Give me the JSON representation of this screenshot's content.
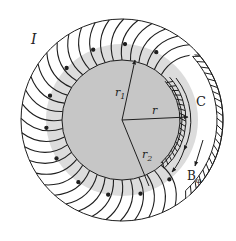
{
  "figure": {
    "colors": {
      "background": "#ffffff",
      "core_fill": "#c8c8c8",
      "annulus_fill": "#dcdcdc",
      "line": "#1e1e1e"
    },
    "labels": {
      "current": "I",
      "inner_radius": "r",
      "inner_radius_sub": "1",
      "outer_radius": "r",
      "outer_radius_sub": "2",
      "loop_radius": "r",
      "loop": "C",
      "field": "B",
      "field_sub": "φ"
    },
    "geometry": {
      "center": [
        122,
        120
      ],
      "core_radius": 60,
      "annulus_radius": 76,
      "outer_radius": 101,
      "winding_count": 44
    }
  }
}
